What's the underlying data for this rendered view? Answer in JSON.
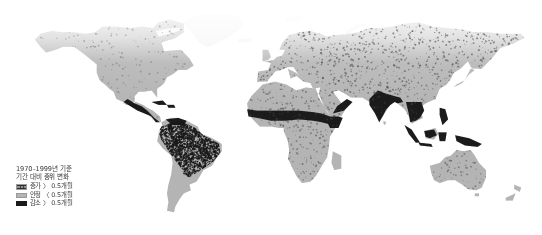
{
  "figure": {
    "type": "choropleth-world-map",
    "width": 542,
    "height": 235,
    "background_color": "#ffffff"
  },
  "legend": {
    "title_line_1": "1970–1999년 기준",
    "title_line_2": "기간 대비 중위 변화",
    "entries": [
      {
        "swatch": "hatched-dark-pattern",
        "label": "증가 〉 0.5개월",
        "color": "#8f8f8f"
      },
      {
        "swatch": "solid-medium-gray",
        "label": "안정 〈 0.5개월",
        "color": "#b4b4b4"
      },
      {
        "swatch": "solid-black",
        "label": "감소 〉 0.5개월",
        "color": "#1b1b1b"
      }
    ]
  },
  "chart_data": {
    "type": "heatmap",
    "title": "1970–1999년 기준 기간 대비 중위 변화",
    "xlabel": "",
    "ylabel": "",
    "projection": "equirectangular",
    "legend_position": "bottom-left",
    "grid": false,
    "categories": [
      "증가 〉 0.5개월",
      "안정 〈 0.5개월",
      "감소 〉 0.5개월"
    ],
    "category_colors": [
      "#8f8f8f",
      "#b4b4b4",
      "#1b1b1b"
    ],
    "regions": [
      {
        "name": "North America",
        "category": "안정 〈 0.5개월",
        "value": 1
      },
      {
        "name": "Mexico / Central America",
        "category": "감소 〉 0.5개월",
        "value": 2
      },
      {
        "name": "Caribbean",
        "category": "감소 〉 0.5개월",
        "value": 2
      },
      {
        "name": "Northern South America",
        "category": "증가 〉 0.5개월",
        "value": 0
      },
      {
        "name": "Amazon Basin",
        "category": "증가 〉 0.5개월",
        "value": 0
      },
      {
        "name": "Southern South America",
        "category": "안정 〈 0.5개월",
        "value": 1
      },
      {
        "name": "Europe",
        "category": "안정 〈 0.5개월",
        "value": 1
      },
      {
        "name": "Russia / Northern Asia",
        "category": "안정 〈 0.5개월",
        "value": 1
      },
      {
        "name": "Sahel / West Africa",
        "category": "감소 〉 0.5개월",
        "value": 2
      },
      {
        "name": "Central Africa",
        "category": "안정 〈 0.5개월",
        "value": 1
      },
      {
        "name": "Horn of Africa",
        "category": "감소 〉 0.5개월",
        "value": 2
      },
      {
        "name": "Southern Africa",
        "category": "안정 〈 0.5개월",
        "value": 1
      },
      {
        "name": "Arabian Peninsula",
        "category": "감소 〉 0.5개월",
        "value": 2
      },
      {
        "name": "India / South Asia",
        "category": "감소 〉 0.5개월",
        "value": 2
      },
      {
        "name": "Southeast Asia",
        "category": "감소 〉 0.5개월",
        "value": 2
      },
      {
        "name": "Indonesia",
        "category": "감소 〉 0.5개월",
        "value": 2
      },
      {
        "name": "New Guinea",
        "category": "감소 〉 0.5개월",
        "value": 2
      },
      {
        "name": "China / East Asia",
        "category": "안정 〈 0.5개월",
        "value": 1
      },
      {
        "name": "Australia",
        "category": "안정 〈 0.5개월",
        "value": 1
      }
    ]
  }
}
